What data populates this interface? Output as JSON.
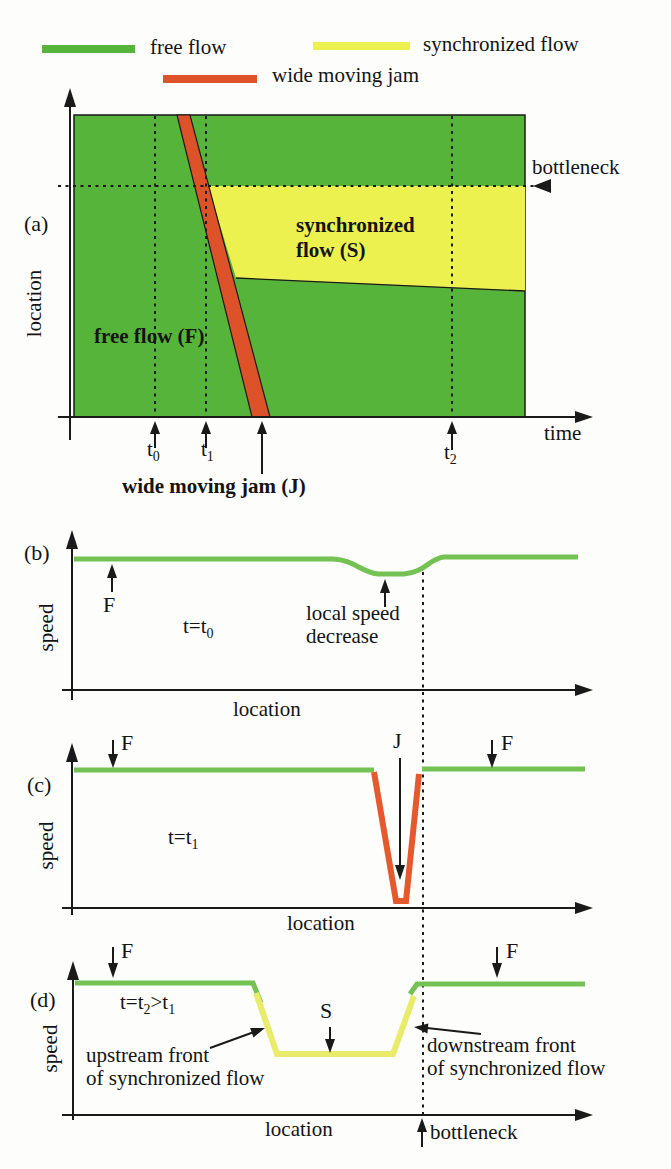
{
  "colors": {
    "green_fill": "#57b43a",
    "green_line": "#74c253",
    "yellow_fill": "#edf14f",
    "yellow_line": "#e9ec6a",
    "red_fill": "#dd5229",
    "red_line": "#e4592e",
    "ink": "#1a1a1a"
  },
  "legend": {
    "free_flow": "free flow",
    "synchronized_flow": "synchronized flow",
    "wide_moving_jam": "wide moving jam"
  },
  "panel_a": {
    "label": "(a)",
    "y_axis": "location",
    "x_axis": "time",
    "bottleneck": "bottleneck",
    "free_flow_region": "free flow (F)",
    "sync_region_line1": "synchronized",
    "sync_region_line2": "flow (S)",
    "jam_caption": "wide moving jam (J)",
    "t0": {
      "base": "t",
      "sub": "0"
    },
    "t1": {
      "base": "t",
      "sub": "1"
    },
    "t2": {
      "base": "t",
      "sub": "2"
    }
  },
  "panel_b": {
    "label": "(b)",
    "y_axis": "speed",
    "x_axis": "location",
    "f": "F",
    "time_eq": {
      "base": "t=t",
      "sub": "0"
    },
    "annotation_line1": "local speed",
    "annotation_line2": "decrease"
  },
  "panel_c": {
    "label": "(c)",
    "y_axis": "speed",
    "x_axis": "location",
    "f_left": "F",
    "f_right": "F",
    "j": "J",
    "time_eq": {
      "base": "t=t",
      "sub": "1"
    }
  },
  "panel_d": {
    "label": "(d)",
    "y_axis": "speed",
    "x_axis": "location",
    "f_left": "F",
    "f_right": "F",
    "s": "S",
    "time_eq": {
      "p1": "t=t",
      "s1": "2",
      "p2": ">t",
      "s2": "1"
    },
    "upstream_line1": "upstream front",
    "upstream_line2": "of synchronized flow",
    "downstream_line1": "downstream front",
    "downstream_line2": "of synchronized flow",
    "bottleneck": "bottleneck"
  }
}
